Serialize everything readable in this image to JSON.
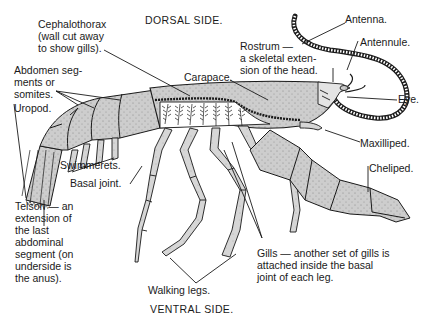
{
  "diagram": {
    "orientation": {
      "top": "DORSAL SIDE.",
      "bottom": "VENTRAL SIDE."
    },
    "labels": {
      "cephalothorax": [
        "Cephalothorax",
        "(wall cut away",
        "to show gills)."
      ],
      "abdomen": [
        "Abdomen  seg-",
        "ments  or",
        "somites."
      ],
      "uropod": "Uropod.",
      "swimmerets": "Swimmerets.",
      "basal_joint": "Basal  joint.",
      "telson": [
        "Telson  —  an",
        "extension  of",
        "the  last",
        "abdominal",
        "segment  (on",
        "underside  is",
        "the  anus)."
      ],
      "carapace": "Carapace.",
      "rostrum": [
        "Rostrum  —",
        "a  skeletal  exten-",
        "sion  of  the  head."
      ],
      "antenna": "Antenna.",
      "antennule": "Antennule.",
      "eye": "Eye.",
      "maxilliped": "Maxilliped.",
      "cheliped": "Cheliped.",
      "gills": [
        "Gills  —  another  set  of  gills  is",
        "attached    inside    the    basal",
        "joint    of  each  leg."
      ],
      "walking_legs": "Walking legs."
    },
    "colors": {
      "ink": "#1a1a1a",
      "body_fill": "#c9c9c9",
      "gill_fill": "#ffffff",
      "background": "#ffffff"
    }
  }
}
